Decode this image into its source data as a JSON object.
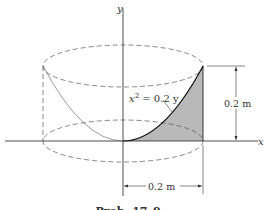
{
  "figure": {
    "y_axis_label": "y",
    "x_axis_label": "x",
    "equation": {
      "base": "x",
      "exponent": "2",
      "rest": " = 0.2 y"
    },
    "height_dimension": "0.2 m",
    "radius_dimension": "0.2 m",
    "caption": "Prob. 17–9"
  },
  "colors": {
    "line": "#222222",
    "dashed": "#555555",
    "shading": "#b9b9b9"
  }
}
